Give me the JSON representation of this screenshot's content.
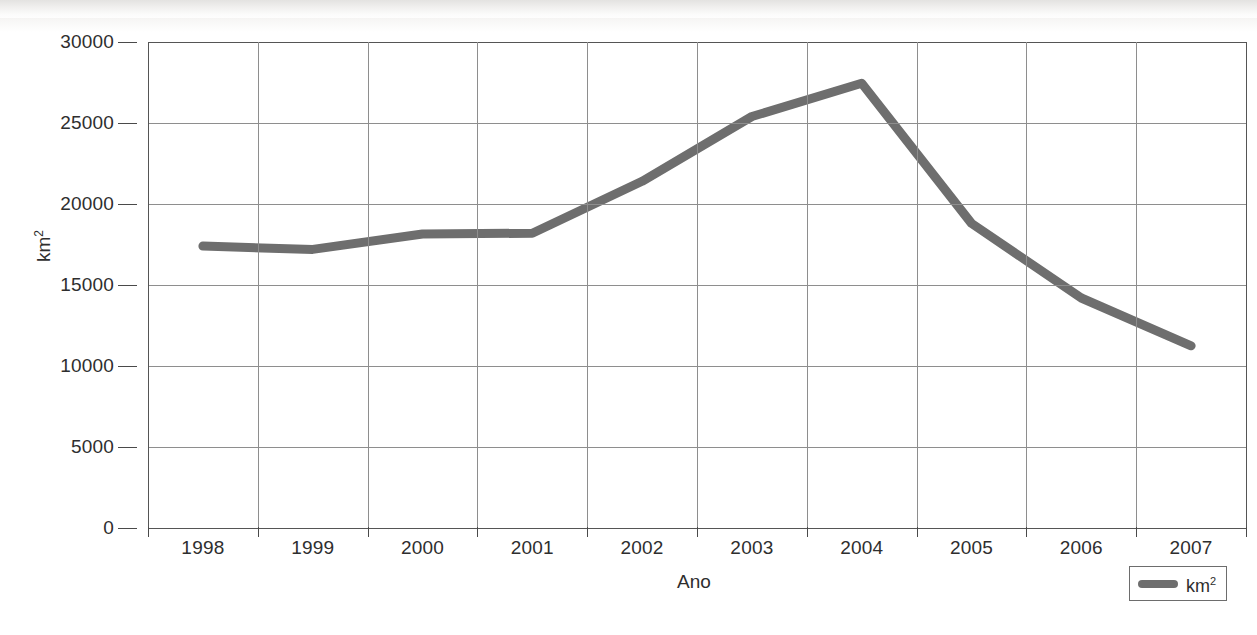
{
  "chart_data": {
    "type": "line",
    "title": "",
    "xlabel": "Ano",
    "ylabel": "km²",
    "categories": [
      "1998",
      "1999",
      "2000",
      "2001",
      "2002",
      "2003",
      "2004",
      "2005",
      "2006",
      "2007"
    ],
    "series": [
      {
        "name": "km²",
        "color": "#6e6e6e",
        "values": [
          17400,
          17200,
          18150,
          18200,
          21400,
          25400,
          27450,
          18800,
          14200,
          11250
        ]
      }
    ],
    "ylim": [
      0,
      30000
    ],
    "y_ticks": [
      0,
      5000,
      10000,
      15000,
      20000,
      25000,
      30000
    ],
    "y_tick_labels": [
      "0",
      "5000",
      "10000",
      "15000",
      "20000",
      "25000",
      "30000"
    ],
    "x_tick_labels": [
      "1998",
      "1999",
      "2000",
      "2001",
      "2002",
      "2003",
      "2004",
      "2005",
      "2006",
      "2007"
    ],
    "grid": true,
    "grid_color": "#8e8e8e",
    "legend_position": "bottom-right",
    "legend_entries": [
      "km²"
    ]
  },
  "axes": {
    "y_title_main": "km",
    "y_title_sup": "2",
    "x_title": "Ano"
  },
  "legend": {
    "label_main": "km",
    "label_sup": "2"
  }
}
